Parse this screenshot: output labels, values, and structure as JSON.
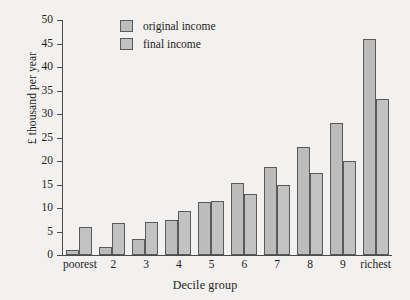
{
  "chart_data": {
    "type": "bar",
    "title": "",
    "xlabel": "Decile group",
    "ylabel": "£ thousand per year",
    "categories": [
      "poorest",
      "2",
      "3",
      "4",
      "5",
      "6",
      "7",
      "8",
      "9",
      "richest"
    ],
    "series": [
      {
        "name": "original income",
        "values": [
          1,
          1.7,
          3.5,
          7.5,
          11.3,
          15.3,
          18.8,
          23,
          28,
          46
        ]
      },
      {
        "name": "final income",
        "values": [
          6,
          6.8,
          7,
          9.3,
          11.5,
          13,
          15,
          17.5,
          20,
          33.3
        ]
      }
    ],
    "ylim": [
      0,
      50
    ],
    "yticks": [
      0,
      5,
      10,
      15,
      20,
      25,
      30,
      35,
      40,
      45,
      50
    ],
    "grid": false,
    "legend_position": "top-center"
  },
  "legend": {
    "items": [
      {
        "label": "original income",
        "swatch": "original-swatch"
      },
      {
        "label": "final income",
        "swatch": "final-swatch"
      }
    ]
  },
  "colors": {
    "background": "#f2f1ef",
    "bar_original": "#bcbcbc",
    "bar_final": "#c2c2c2",
    "bar_outline": "#5a5a5a",
    "axis": "#4a4a4a",
    "text": "#1c1c1c"
  }
}
